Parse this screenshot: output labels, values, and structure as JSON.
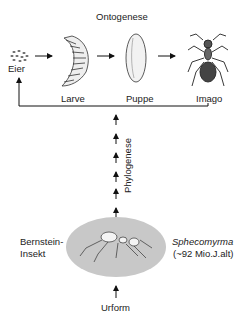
{
  "ontogeny": {
    "title": "Ontogenese",
    "stages": [
      {
        "label": "Eier",
        "icon": "eggs-icon"
      },
      {
        "label": "Larve",
        "icon": "larva-icon"
      },
      {
        "label": "Puppe",
        "icon": "pupa-icon"
      },
      {
        "label": "Imago",
        "icon": "ant-imago-icon"
      }
    ]
  },
  "phylogeny": {
    "label": "Phylogenese"
  },
  "fossil": {
    "left_label_line1": "Bernstein-",
    "left_label_line2": "Insekt",
    "species_name": "Sphecomyrma",
    "age": "(~92 Mio.J.alt)",
    "ellipse_color": "#c8c8c8"
  },
  "origin": {
    "label": "Urform"
  }
}
